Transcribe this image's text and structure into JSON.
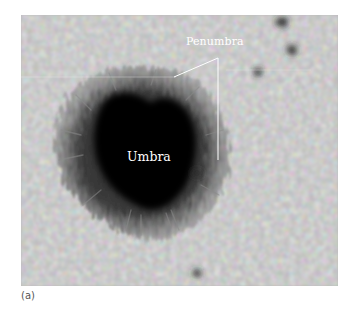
{
  "figure": {
    "labels": {
      "penumbra": "Penumbra",
      "umbra": "Umbra"
    },
    "caption": "(a)"
  },
  "colors": {
    "background": "#ffffff",
    "granulation_light": "#c8c8c8",
    "granulation_dark": "#8a8a8a",
    "penumbra": "#4a4a4a",
    "umbra": "#0a0a0a",
    "label_text": "#ffffff",
    "caption_text": "#555555"
  }
}
